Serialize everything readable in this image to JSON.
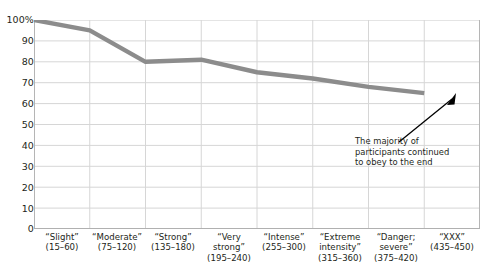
{
  "chart_data": {
    "type": "line",
    "title": "",
    "xlabel": "",
    "ylabel": "",
    "ylim": [
      0,
      100
    ],
    "yticks": [
      "100%",
      "90",
      "80",
      "70",
      "60",
      "50",
      "40",
      "30",
      "20",
      "10",
      "0"
    ],
    "ytick_values": [
      100,
      90,
      80,
      70,
      60,
      50,
      40,
      30,
      20,
      10,
      0
    ],
    "grid": true,
    "legend": "none",
    "categories": [
      "“Slight” (15–60)",
      "“Moderate” (75–120)",
      "“Strong” (135–180)",
      "“Very strong” (195–240)",
      "“Intense” (255–300)",
      "“Extreme intensity” (315–360)",
      "“Danger; severe” (375–420)",
      "“XXX” (435–450)"
    ],
    "category_labels": [
      {
        "l1": "“Slight”",
        "l2": "(15–60)",
        "l3": ""
      },
      {
        "l1": "“Moderate”",
        "l2": "(75–120)",
        "l3": ""
      },
      {
        "l1": "“Strong”",
        "l2": "(135–180)",
        "l3": ""
      },
      {
        "l1": "“Very",
        "l2": "strong”",
        "l3": "(195–240)"
      },
      {
        "l1": "“Intense”",
        "l2": "(255–300)",
        "l3": ""
      },
      {
        "l1": "“Extreme",
        "l2": "intensity”",
        "l3": "(315–360)"
      },
      {
        "l1": "“Danger;",
        "l2": "severe”",
        "l3": "(375–420)"
      },
      {
        "l1": "“XXX”",
        "l2": "(435–450)",
        "l3": ""
      }
    ],
    "values": [
      100,
      95,
      80,
      81,
      75,
      72,
      68,
      65
    ],
    "series": [
      {
        "name": "Percent of participants still obeying",
        "values": [
          100,
          95,
          80,
          81,
          75,
          72,
          68,
          65
        ]
      }
    ],
    "line_color": "#8c8c8c",
    "grid_color": "#d4d4d4",
    "annotations": [
      {
        "line1": "The majority of",
        "line2": "participants continued",
        "line3": "to obey to the end",
        "points_to": "“XXX” (435–450)"
      }
    ]
  }
}
